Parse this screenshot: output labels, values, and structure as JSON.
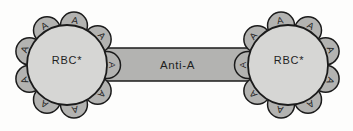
{
  "diagram": {
    "antibody_bar": {
      "label": "Anti-A"
    },
    "cells": [
      {
        "side": "left",
        "label": "RBC*",
        "antigen_label": "A",
        "antigen_count": 9
      },
      {
        "side": "right",
        "label": "RBC*",
        "antigen_label": "A",
        "antigen_count": 9
      }
    ],
    "colors": {
      "background": "#fdfdfc",
      "cell_fill": "#d6d6d4",
      "antigen_fill": "#b3b3b1",
      "bar_fill": "#b3b3b1",
      "outline": "#1b1b1b",
      "text": "#1f1f1f"
    }
  }
}
